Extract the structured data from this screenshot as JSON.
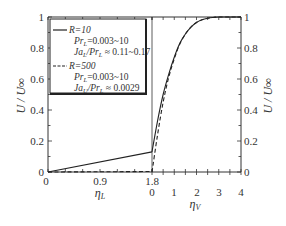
{
  "chart_data": {
    "type": "line",
    "title": "",
    "layout": "dual-panel shared y-axis: left panel η_L (liquid), right panel η_V (vapor)",
    "ylabel": "U / U∞",
    "ylim": [
      0,
      1
    ],
    "yticks": [
      "0",
      "0.2",
      "0.4",
      "0.6",
      "0.8",
      "1"
    ],
    "panels": [
      {
        "name": "liquid",
        "xlabel": "ηL",
        "xlim": [
          0,
          1.8
        ],
        "xticks": [
          "0",
          "0.9",
          "1.8"
        ]
      },
      {
        "name": "vapor",
        "xlabel": "ηV",
        "xlim": [
          0,
          4
        ],
        "xticks": [
          "0",
          "1",
          "2",
          "3",
          "4"
        ]
      }
    ],
    "series": [
      {
        "name": "R=10",
        "style": "solid",
        "liquid": {
          "x": [
            0,
            1.8
          ],
          "y": [
            0,
            0.13
          ]
        },
        "vapor": {
          "x": [
            0,
            0.25,
            0.5,
            0.75,
            1.0,
            1.25,
            1.5,
            1.75,
            2.0,
            2.25,
            2.5,
            2.75,
            3.0,
            3.5,
            4.0
          ],
          "y": [
            0.13,
            0.33,
            0.5,
            0.63,
            0.74,
            0.83,
            0.89,
            0.935,
            0.965,
            0.982,
            0.992,
            0.997,
            1.0,
            1.0,
            1.0
          ]
        }
      },
      {
        "name": "R=500",
        "style": "dashed",
        "liquid": {
          "x": [
            0,
            1.8
          ],
          "y": [
            0,
            0.003
          ]
        },
        "vapor": {
          "x": [
            0,
            0.25,
            0.5,
            0.75,
            1.0,
            1.25,
            1.5,
            1.75,
            2.0,
            2.25,
            2.5,
            2.75,
            3.0,
            3.5,
            4.0
          ],
          "y": [
            0.0,
            0.24,
            0.45,
            0.61,
            0.73,
            0.825,
            0.89,
            0.935,
            0.965,
            0.982,
            0.992,
            0.997,
            1.0,
            1.0,
            1.0
          ]
        }
      }
    ],
    "legend": {
      "position": "upper-left of left panel",
      "entries": [
        {
          "style": "solid",
          "label": "R=10",
          "line2": "PrL=0.003~10",
          "line3": "JaL/PrL ≈ 0.11~0.17"
        },
        {
          "style": "dashed",
          "label": "R=500",
          "line2": "PrL=0.003~10",
          "line3": "JaU/PrL ≈ 0.0029"
        }
      ]
    },
    "grid": false
  },
  "labels": {
    "y_left": "U / U∞",
    "y_right": "U / U∞",
    "x_left": "ηL",
    "x_right": "ηV",
    "y_ticks": [
      "0",
      "0.2",
      "0.4",
      "0.6",
      "0.8",
      "1"
    ],
    "x_left_ticks": [
      "0",
      "0.9",
      "1.8"
    ],
    "x_right_ticks": [
      "0",
      "1",
      "2",
      "3",
      "4"
    ]
  },
  "legend": {
    "r10": "R=10",
    "r10_pr": "Pr",
    "r10_pr_sub": "L",
    "r10_pr_val": "=0.003~10",
    "r10_ja": "Ja",
    "r10_ja_sub1": "L",
    "r10_ja_mid": "/Pr",
    "r10_ja_sub2": "L",
    "r10_ja_val": " ≈ 0.11~0.17",
    "r500": "R=500",
    "r500_pr": "Pr",
    "r500_pr_sub": "L",
    "r500_pr_val": "=0.003~10",
    "r500_ja": "Ja",
    "r500_ja_sub1": "U",
    "r500_ja_mid": "/Pr",
    "r500_ja_sub2": "L",
    "r500_ja_val": " ≈ 0.0029"
  }
}
